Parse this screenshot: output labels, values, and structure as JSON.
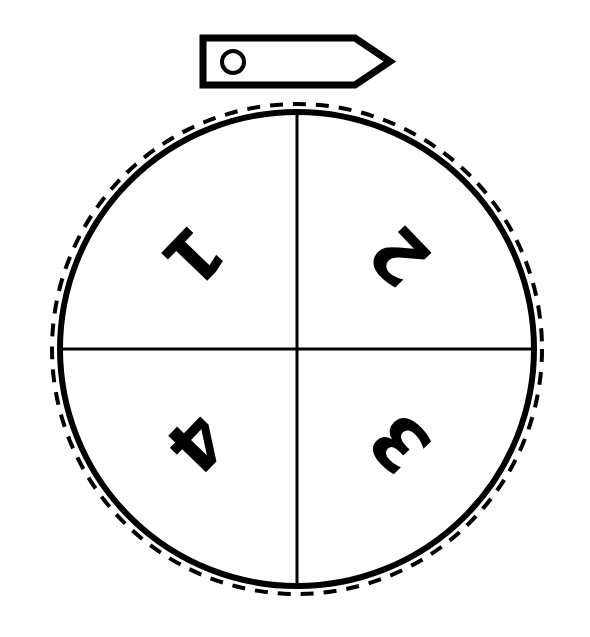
{
  "figure": {
    "kind": "spinner-diagram",
    "background_color": "#ffffff",
    "ink_color": "#000000",
    "canvas": {
      "width": 590,
      "height": 637
    }
  },
  "pointer": {
    "name": "spinner-pointer",
    "shape": "flag-arrow-right",
    "left": 203,
    "right": 390,
    "top": 38,
    "bottom": 85,
    "body_right": 355,
    "tip_x": 390,
    "tip_y": 61.5,
    "stroke_width": 7,
    "pivot_hole": {
      "cx": 233,
      "cy": 62,
      "r": 11,
      "stroke_width": 4
    }
  },
  "wheel": {
    "name": "spinner-wheel",
    "center_x": 297,
    "center_y": 349,
    "solid_radius": 237,
    "solid_stroke_width": 6,
    "dashed_radius": 245,
    "dashed_stroke_width": 4,
    "dash_pattern": "13 10",
    "divider_stroke_width": 3
  },
  "dividers": [
    {
      "name": "divider-vertical",
      "x1": 297,
      "y1": 112,
      "x2": 297,
      "y2": 586
    },
    {
      "name": "divider-horizontal",
      "x1": 60,
      "y1": 349,
      "x2": 535,
      "y2": 349
    }
  ],
  "sectors": [
    {
      "name": "sector-1",
      "label": "1",
      "quadrant": "upper-left",
      "label_x": 193,
      "label_y": 256,
      "rotation_deg": 134,
      "font_size": 72
    },
    {
      "name": "sector-2",
      "label": "2",
      "quadrant": "upper-right",
      "label_x": 400,
      "label_y": 256,
      "rotation_deg": 226,
      "font_size": 72
    },
    {
      "name": "sector-3",
      "label": "3",
      "quadrant": "lower-right",
      "label_x": 400,
      "label_y": 443,
      "rotation_deg": 226,
      "font_size": 72
    },
    {
      "name": "sector-4",
      "label": "4",
      "quadrant": "lower-left",
      "label_x": 196,
      "label_y": 443,
      "rotation_deg": 134,
      "font_size": 72
    }
  ]
}
